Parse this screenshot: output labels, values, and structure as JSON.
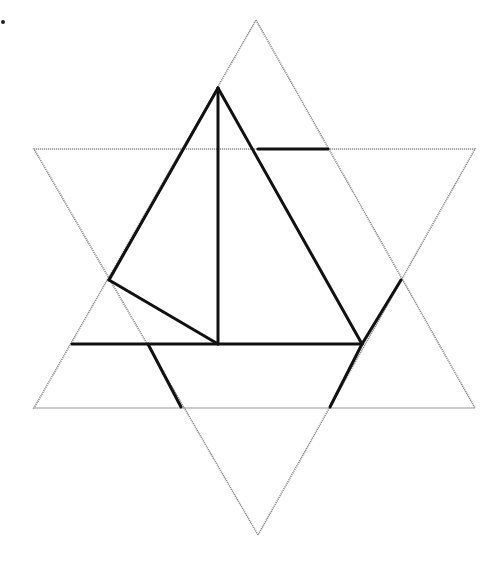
{
  "diagram": {
    "type": "geometric-figure",
    "colors": {
      "background": "#ffffff",
      "thin_outline": "#8a8a8a",
      "bold_line": "#111111"
    },
    "triangles": [
      {
        "name": "upward-triangle",
        "points": [
          [
            256,
            20
          ],
          [
            475,
            408
          ],
          [
            34,
            408
          ]
        ]
      },
      {
        "name": "downward-triangle",
        "points": [
          [
            34,
            149
          ],
          [
            475,
            149
          ],
          [
            258,
            535
          ]
        ]
      }
    ],
    "bold_segments": [
      {
        "name": "vertical-segment",
        "from": [
          218,
          88
        ],
        "to": [
          218,
          344
        ]
      },
      {
        "name": "left-upper-edge",
        "from": [
          218,
          88
        ],
        "to": [
          109,
          280
        ]
      },
      {
        "name": "left-inner-diagonal",
        "from": [
          109,
          280
        ],
        "to": [
          218,
          344
        ]
      },
      {
        "name": "right-long-diagonal",
        "from": [
          218,
          88
        ],
        "to": [
          362,
          344
        ]
      },
      {
        "name": "horizontal-base",
        "from": [
          72,
          344
        ],
        "to": [
          362,
          344
        ]
      },
      {
        "name": "top-right-horizontal",
        "from": [
          258,
          149
        ],
        "to": [
          328,
          149
        ]
      },
      {
        "name": "right-upper-edge",
        "from": [
          362,
          344
        ],
        "to": [
          401,
          280
        ]
      },
      {
        "name": "right-lower-edge",
        "from": [
          362,
          344
        ],
        "to": [
          330,
          407
        ]
      },
      {
        "name": "left-lower-diagonal",
        "from": [
          148,
          344
        ],
        "to": [
          181,
          407
        ]
      }
    ],
    "marker": {
      "name": "corner-dot",
      "at": [
        3,
        22
      ]
    }
  }
}
